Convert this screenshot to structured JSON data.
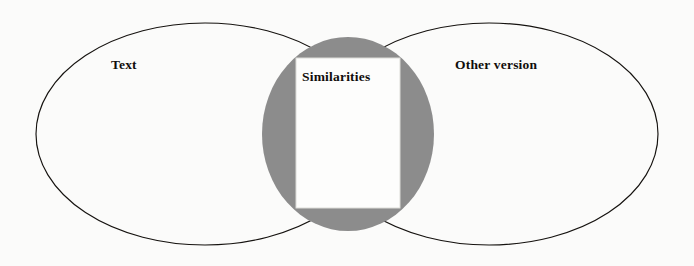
{
  "diagram": {
    "type": "venn-diagram",
    "canvas": {
      "width": 694,
      "height": 266,
      "background_color": "#fbfbfa"
    },
    "left_set": {
      "label": "Text",
      "shape": "ellipse",
      "fill_color": "none",
      "stroke_color": "#15120f",
      "cx": 205,
      "cy": 134,
      "rx": 169,
      "ry": 111
    },
    "right_set": {
      "label": "Other version",
      "shape": "ellipse",
      "fill_color": "none",
      "stroke_color": "#15120f",
      "cx": 489,
      "cy": 134,
      "rx": 169,
      "ry": 111
    },
    "overlap": {
      "label": "Similarities",
      "shape": "ellipse",
      "fill_color": "#8c8c8c",
      "cx": 348,
      "cy": 134,
      "rx": 86,
      "ry": 97
    },
    "note_card": {
      "shape": "rectangle",
      "fill_color": "#fdfdfc",
      "stroke_color": "#dcdcd8",
      "x": 296,
      "y": 58,
      "width": 104,
      "height": 150
    }
  }
}
